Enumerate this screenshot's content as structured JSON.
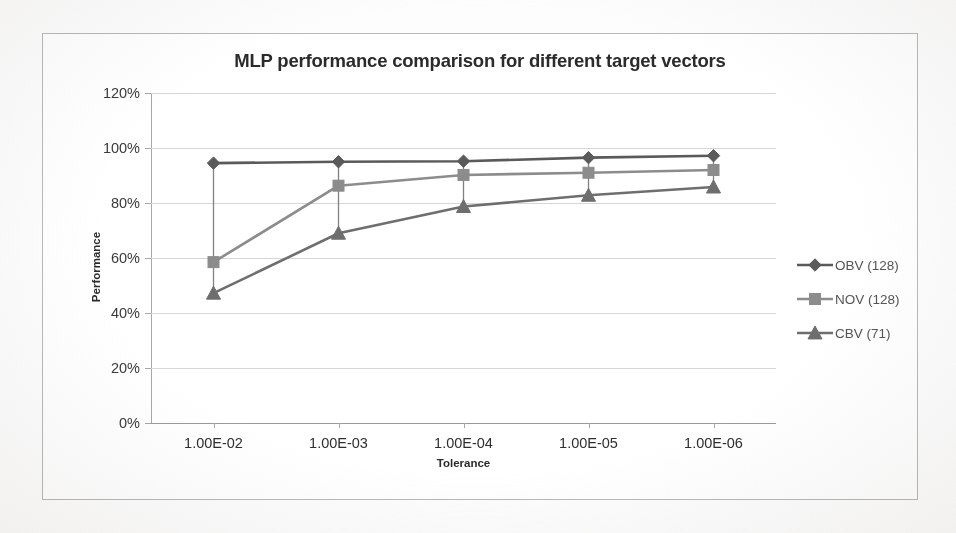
{
  "chart_data": {
    "type": "line",
    "title": "MLP performance comparison for different target vectors",
    "xlabel": "Tolerance",
    "ylabel": "Performance",
    "categories": [
      "1.00E-02",
      "1.00E-03",
      "1.00E-04",
      "1.00E-05",
      "1.00E-06"
    ],
    "ylim": [
      0,
      120
    ],
    "ytick_labels": [
      "0%",
      "20%",
      "40%",
      "60%",
      "80%",
      "100%",
      "120%"
    ],
    "ytick_values": [
      0,
      20,
      40,
      60,
      80,
      100,
      120
    ],
    "grid": true,
    "legend_position": "right",
    "series": [
      {
        "name": "OBV (128)",
        "marker": "diamond",
        "color": "#5a5a5a",
        "values": [
          94.5,
          95.0,
          95.2,
          96.5,
          97.2
        ]
      },
      {
        "name": "NOV (128)",
        "marker": "square",
        "color": "#8c8c8c",
        "values": [
          58.5,
          86.3,
          90.2,
          91.0,
          92.0
        ]
      },
      {
        "name": "CBV (71)",
        "marker": "triangle",
        "color": "#6e6e6e",
        "values": [
          47.2,
          69.0,
          78.7,
          82.8,
          85.8
        ]
      }
    ]
  },
  "colors": {
    "frame_border": "#b9b9b9",
    "gridline": "#d6d6d6",
    "axis": "#a8a8a8",
    "title_text": "#2b2b2b",
    "tick_text": "#3a3a3a",
    "legend_text": "#555555",
    "page_background": "#fdfdfd"
  }
}
